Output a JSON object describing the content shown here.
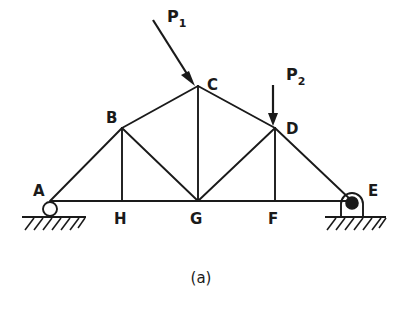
{
  "figure": {
    "caption": "(a)",
    "type": "truss-free-body-diagram",
    "line_color": "#1a1a1a",
    "background_color": "#ffffff"
  },
  "nodes": [
    {
      "id": "A",
      "label": "A",
      "x": 50,
      "y": 201,
      "label_x": 33,
      "label_y": 190
    },
    {
      "id": "B",
      "label": "B",
      "x": 122,
      "y": 128,
      "label_x": 108,
      "label_y": 118
    },
    {
      "id": "C",
      "label": "C",
      "x": 198,
      "y": 86,
      "label_x": 208,
      "label_y": 84
    },
    {
      "id": "D",
      "label": "D",
      "x": 275,
      "y": 128,
      "label_x": 285,
      "label_y": 128
    },
    {
      "id": "E",
      "label": "E",
      "x": 352,
      "y": 201,
      "label_x": 366,
      "label_y": 193
    },
    {
      "id": "F",
      "label": "F",
      "x": 275,
      "y": 201,
      "label_x": 269,
      "label_y": 222
    },
    {
      "id": "G",
      "label": "G",
      "x": 198,
      "y": 201,
      "label_x": 192,
      "label_y": 223
    },
    {
      "id": "H",
      "label": "H",
      "x": 122,
      "y": 201,
      "label_x": 115,
      "label_y": 222
    }
  ],
  "members": [
    {
      "name": "A-B",
      "from": "A",
      "to": "B",
      "kind": "top-chord"
    },
    {
      "name": "B-C",
      "from": "B",
      "to": "C",
      "kind": "top-chord"
    },
    {
      "name": "C-D",
      "from": "C",
      "to": "D",
      "kind": "top-chord"
    },
    {
      "name": "D-E",
      "from": "D",
      "to": "E",
      "kind": "top-chord"
    },
    {
      "name": "A-E",
      "from": "A",
      "to": "E",
      "kind": "bottom-chord"
    },
    {
      "name": "B-H",
      "from": "B",
      "to": "H",
      "kind": "vertical"
    },
    {
      "name": "C-G",
      "from": "C",
      "to": "G",
      "kind": "vertical"
    },
    {
      "name": "D-F",
      "from": "D",
      "to": "F",
      "kind": "vertical"
    },
    {
      "name": "B-G",
      "from": "B",
      "to": "G",
      "kind": "diagonal"
    },
    {
      "name": "D-G",
      "from": "D",
      "to": "G",
      "kind": "diagonal"
    }
  ],
  "loads": [
    {
      "id": "P1",
      "base": "P",
      "subscript": "1",
      "direction": "diagonal-down-right",
      "applied_at": "C",
      "tail_x": 153,
      "tail_y": 20,
      "head_x": 193,
      "head_y": 83,
      "label_x": 167,
      "label_y": 18
    },
    {
      "id": "P2",
      "base": "P",
      "subscript": "2",
      "direction": "vertical-down",
      "applied_at": "D",
      "tail_x": 273,
      "tail_y": 85,
      "head_x": 273,
      "head_y": 125,
      "label_x": 286,
      "label_y": 76
    }
  ],
  "supports": [
    {
      "id": "support-A",
      "at_node": "A",
      "type": "roller",
      "circle_x": 50,
      "circle_y": 209,
      "radius": 7,
      "ground_y": 217,
      "ground_x1": 22,
      "ground_x2": 86
    },
    {
      "id": "support-E",
      "at_node": "E",
      "type": "pin",
      "circle_x": 352,
      "circle_y": 203,
      "radius": 6,
      "ground_y": 217,
      "ground_x1": 325,
      "ground_x2": 386
    }
  ]
}
